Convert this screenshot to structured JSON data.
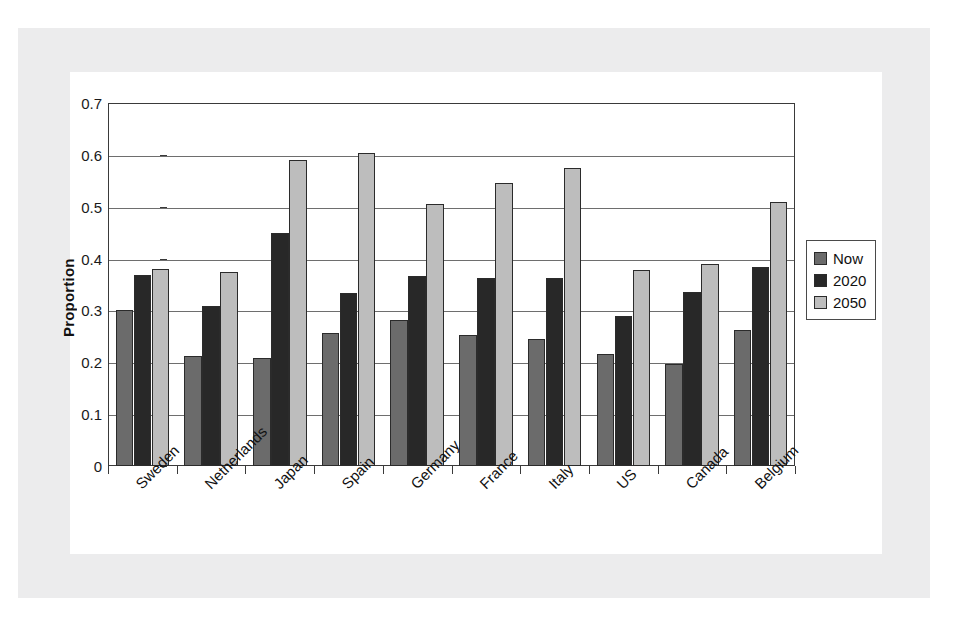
{
  "chart_data": {
    "type": "bar",
    "title": "",
    "xlabel": "",
    "ylabel": "Proportion",
    "ylim": [
      0,
      0.7
    ],
    "ytick_labels": [
      "0",
      "0.1",
      "0.2",
      "0.3",
      "0.4",
      "0.5",
      "0.6",
      "0.7"
    ],
    "ytick_values": [
      0,
      0.1,
      0.2,
      0.3,
      0.4,
      0.5,
      0.6,
      0.7
    ],
    "grid": "horizontal",
    "legend_position": "right",
    "categories": [
      "Sweden",
      "Netherlands",
      "Japan",
      "Spain",
      "Germany",
      "France",
      "Italy",
      "US",
      "Canada",
      "Belgium"
    ],
    "series": [
      {
        "name": "Now",
        "color": "#6b6b6b",
        "values": [
          0.3,
          0.212,
          0.209,
          0.257,
          0.282,
          0.252,
          0.245,
          0.216,
          0.196,
          0.262
        ]
      },
      {
        "name": "2020",
        "color": "#282828",
        "values": [
          0.368,
          0.308,
          0.45,
          0.333,
          0.367,
          0.363,
          0.362,
          0.29,
          0.336,
          0.383
        ]
      },
      {
        "name": "2050",
        "color": "#bdbdbd",
        "values": [
          0.38,
          0.375,
          0.59,
          0.603,
          0.505,
          0.545,
          0.575,
          0.378,
          0.389,
          0.51
        ]
      }
    ]
  }
}
